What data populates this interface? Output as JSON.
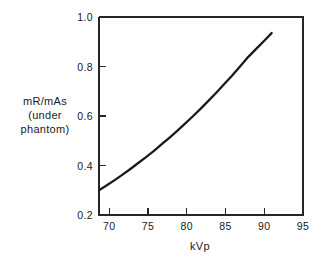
{
  "chart_data": {
    "type": "line",
    "title": "",
    "xlabel": "kVp",
    "ylabel": "mR/mAs (under phantom)",
    "ylabel_lines": [
      "mR/mAs",
      "(under",
      "phantom)"
    ],
    "xlim": [
      69.0,
      95.0
    ],
    "ylim": [
      0.2,
      1.0
    ],
    "xticks": [
      70,
      75,
      80,
      85,
      90,
      95
    ],
    "xtick_labels": [
      "70",
      "75",
      "80",
      "85",
      "90",
      "95"
    ],
    "yticks": [
      0.2,
      0.4,
      0.6,
      0.8,
      1.0
    ],
    "ytick_labels": [
      "0.2",
      "0.4",
      "0.6",
      "0.8",
      "1.0"
    ],
    "grid": false,
    "legend": false,
    "series": [
      {
        "name": "mR/mAs vs kVp",
        "color": "#1a1a1a",
        "x": [
          69.0,
          70.0,
          71.0,
          72.0,
          73.0,
          74.0,
          75.0,
          76.0,
          77.0,
          78.0,
          79.0,
          80.0,
          81.0,
          82.0,
          83.0,
          84.0,
          85.0,
          86.0,
          87.0,
          88.0,
          89.0,
          90.0,
          91.0
        ],
        "y": [
          0.3,
          0.32,
          0.341,
          0.363,
          0.386,
          0.41,
          0.434,
          0.459,
          0.486,
          0.513,
          0.541,
          0.57,
          0.6,
          0.631,
          0.663,
          0.696,
          0.73,
          0.765,
          0.801,
          0.838,
          0.87,
          0.902,
          0.935
        ]
      }
    ]
  },
  "axes": {
    "xlabel": "kVp",
    "ylabel_lines": [
      "mR/mAs",
      "(under",
      "phantom)"
    ]
  }
}
